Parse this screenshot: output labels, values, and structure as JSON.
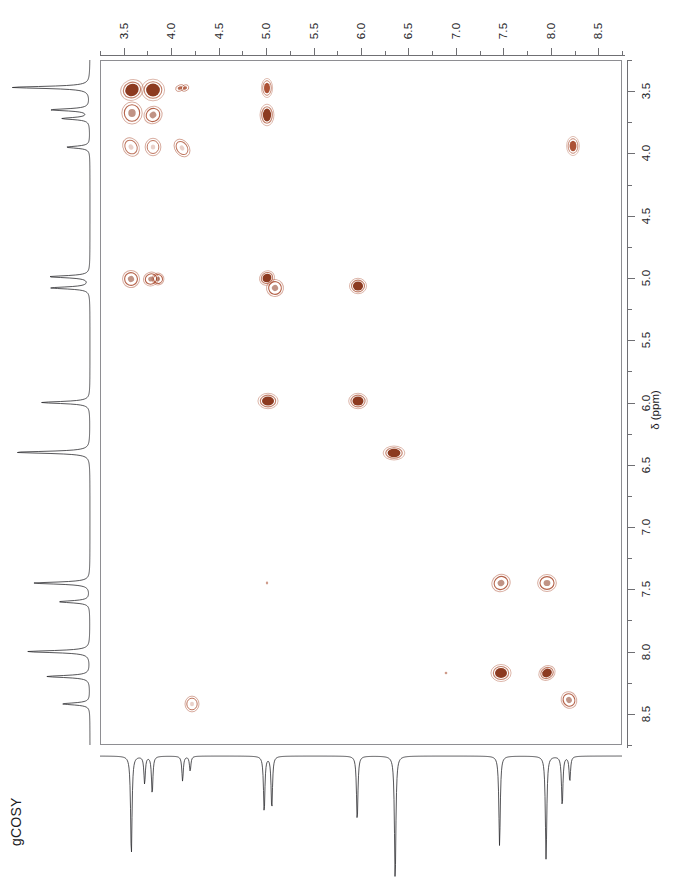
{
  "experiment": {
    "label": "gCOSY",
    "peak_color": "#a8482a",
    "peak_core_color": "#8c3a20",
    "axis_color": "#6f6f73",
    "trace_color": "#2b2b2e"
  },
  "axes": {
    "f2": {
      "name": "horizontal-axis",
      "position": "top",
      "unit": "ppm",
      "min": 3.25,
      "max": 8.75,
      "direction": "increasing-right",
      "major_step": 0.5,
      "minor_step": 0.25,
      "tick_labels": [
        "3.5",
        "4.0",
        "4.5",
        "5.0",
        "5.5",
        "6.0",
        "6.5",
        "7.0",
        "7.5",
        "8.0",
        "8.5"
      ],
      "tick_values": [
        3.5,
        4.0,
        4.5,
        5.0,
        5.5,
        6.0,
        6.5,
        7.0,
        7.5,
        8.0,
        8.5
      ]
    },
    "f1": {
      "name": "vertical-axis",
      "position": "right",
      "unit": "ppm",
      "title": "δ (ppm)",
      "min": 3.25,
      "max": 8.75,
      "direction": "increasing-down",
      "major_step": 0.5,
      "minor_step": 0.25,
      "tick_labels": [
        "3.5",
        "4.0",
        "4.5",
        "5.0",
        "5.5",
        "6.0",
        "6.5",
        "7.0",
        "7.5",
        "8.0",
        "8.5"
      ],
      "tick_values": [
        3.5,
        4.0,
        4.5,
        5.0,
        5.5,
        6.0,
        6.5,
        7.0,
        7.5,
        8.0,
        8.5
      ]
    }
  },
  "chart_data": {
    "type": "scatter",
    "title": "gCOSY",
    "xlabel": "δ (ppm)",
    "ylabel": "δ (ppm)",
    "xlim": [
      3.25,
      8.75
    ],
    "ylim": [
      3.25,
      8.75
    ],
    "grid": false,
    "legend": "none",
    "x_axis_position": "top",
    "y_axis_position": "right",
    "x_reversed": false,
    "y_reversed": false,
    "cross_peaks": [
      {
        "f2": 3.58,
        "f1": 3.48,
        "rx": 7.5,
        "ry": 6.5,
        "rot": -25,
        "intensity": "strong"
      },
      {
        "f2": 3.8,
        "f1": 3.48,
        "rx": 7.5,
        "ry": 7.0,
        "rot": 0,
        "intensity": "strong"
      },
      {
        "f2": 4.08,
        "f1": 3.47,
        "rx": 3.0,
        "ry": 2.0,
        "rot": -20,
        "intensity": "weak"
      },
      {
        "f2": 4.14,
        "f1": 3.47,
        "rx": 2.6,
        "ry": 2.0,
        "rot": -20,
        "intensity": "weak"
      },
      {
        "f2": 5.0,
        "f1": 3.47,
        "rx": 3.5,
        "ry": 6.0,
        "rot": 0,
        "intensity": "medium"
      },
      {
        "f2": 8.22,
        "f1": 3.93,
        "rx": 4.0,
        "ry": 6.0,
        "rot": 0,
        "intensity": "medium"
      },
      {
        "f2": 3.58,
        "f1": 3.67,
        "rx": 6.0,
        "ry": 6.5,
        "rot": 0,
        "intensity": "ring"
      },
      {
        "f2": 3.8,
        "f1": 3.68,
        "rx": 5.5,
        "ry": 5.0,
        "rot": -35,
        "intensity": "ring"
      },
      {
        "f2": 5.0,
        "f1": 3.68,
        "rx": 4.5,
        "ry": 7.0,
        "rot": 0,
        "intensity": "strong"
      },
      {
        "f2": 3.57,
        "f1": 3.94,
        "rx": 4.5,
        "ry": 5.5,
        "rot": -30,
        "intensity": "ring-light"
      },
      {
        "f2": 3.8,
        "f1": 3.94,
        "rx": 4.5,
        "ry": 5.0,
        "rot": 0,
        "intensity": "ring-light"
      },
      {
        "f2": 4.1,
        "f1": 3.95,
        "rx": 4.0,
        "ry": 5.5,
        "rot": -35,
        "intensity": "ring-light"
      },
      {
        "f2": 3.57,
        "f1": 5.0,
        "rx": 5.0,
        "ry": 5.0,
        "rot": -25,
        "intensity": "ring"
      },
      {
        "f2": 3.78,
        "f1": 5.0,
        "rx": 4.5,
        "ry": 4.0,
        "rot": -20,
        "intensity": "ring"
      },
      {
        "f2": 3.85,
        "f1": 5.0,
        "rx": 3.5,
        "ry": 3.5,
        "rot": -20,
        "intensity": "ring"
      },
      {
        "f2": 5.0,
        "f1": 4.99,
        "rx": 5.0,
        "ry": 4.5,
        "rot": -35,
        "intensity": "strong"
      },
      {
        "f2": 5.08,
        "f1": 5.07,
        "rx": 5.0,
        "ry": 5.0,
        "rot": -35,
        "intensity": "ring"
      },
      {
        "f2": 5.96,
        "f1": 5.06,
        "rx": 5.5,
        "ry": 5.0,
        "rot": 0,
        "intensity": "strong"
      },
      {
        "f2": 5.01,
        "f1": 5.98,
        "rx": 6.5,
        "ry": 5.0,
        "rot": 0,
        "intensity": "strong"
      },
      {
        "f2": 5.96,
        "f1": 5.98,
        "rx": 6.0,
        "ry": 5.0,
        "rot": 0,
        "intensity": "strong"
      },
      {
        "f2": 6.34,
        "f1": 6.4,
        "rx": 7.0,
        "ry": 4.5,
        "rot": 0,
        "intensity": "strong"
      },
      {
        "f2": 5.0,
        "f1": 7.44,
        "rx": 1.2,
        "ry": 1.4,
        "rot": 0,
        "intensity": "trace"
      },
      {
        "f2": 7.46,
        "f1": 7.44,
        "rx": 5.5,
        "ry": 5.0,
        "rot": -30,
        "intensity": "ring"
      },
      {
        "f2": 7.95,
        "f1": 7.44,
        "rx": 5.5,
        "ry": 5.0,
        "rot": 0,
        "intensity": "ring"
      },
      {
        "f2": 6.88,
        "f1": 8.16,
        "rx": 1.3,
        "ry": 1.3,
        "rot": 0,
        "intensity": "trace"
      },
      {
        "f2": 7.46,
        "f1": 8.16,
        "rx": 6.5,
        "ry": 5.5,
        "rot": 0,
        "intensity": "strong"
      },
      {
        "f2": 7.95,
        "f1": 8.16,
        "rx": 5.5,
        "ry": 4.5,
        "rot": -30,
        "intensity": "strong"
      },
      {
        "f2": 8.18,
        "f1": 8.38,
        "rx": 4.5,
        "ry": 5.0,
        "rot": -30,
        "intensity": "ring"
      },
      {
        "f2": 4.21,
        "f1": 8.41,
        "rx": 4.0,
        "ry": 4.5,
        "rot": 0,
        "intensity": "ring-light"
      }
    ],
    "f2_projection_peaks": [
      {
        "ppm": 3.58,
        "height": 0.8
      },
      {
        "ppm": 3.72,
        "height": 0.22
      },
      {
        "ppm": 3.8,
        "height": 0.3
      },
      {
        "ppm": 4.12,
        "height": 0.2
      },
      {
        "ppm": 4.2,
        "height": 0.12
      },
      {
        "ppm": 4.98,
        "height": 0.45
      },
      {
        "ppm": 5.06,
        "height": 0.42
      },
      {
        "ppm": 5.96,
        "height": 0.52
      },
      {
        "ppm": 6.36,
        "height": 1.0
      },
      {
        "ppm": 7.46,
        "height": 0.72
      },
      {
        "ppm": 7.95,
        "height": 0.83
      },
      {
        "ppm": 8.12,
        "height": 0.4
      },
      {
        "ppm": 8.2,
        "height": 0.2
      }
    ],
    "f1_projection_peaks": [
      {
        "ppm": 3.47,
        "height": 1.0
      },
      {
        "ppm": 3.65,
        "height": 0.5
      },
      {
        "ppm": 3.72,
        "height": 0.35
      },
      {
        "ppm": 3.95,
        "height": 0.3
      },
      {
        "ppm": 4.99,
        "height": 0.52
      },
      {
        "ppm": 5.08,
        "height": 0.5
      },
      {
        "ppm": 6.0,
        "height": 0.62
      },
      {
        "ppm": 6.4,
        "height": 0.95
      },
      {
        "ppm": 7.45,
        "height": 0.72
      },
      {
        "ppm": 7.6,
        "height": 0.4
      },
      {
        "ppm": 8.0,
        "height": 0.8
      },
      {
        "ppm": 8.2,
        "height": 0.55
      },
      {
        "ppm": 8.42,
        "height": 0.35
      }
    ]
  }
}
